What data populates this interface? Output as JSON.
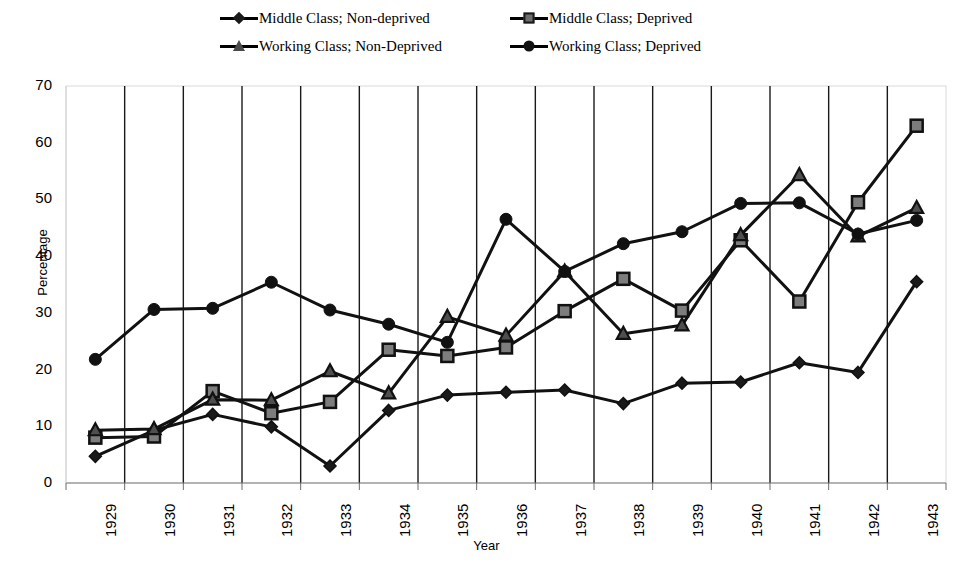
{
  "chart_data": {
    "type": "line",
    "title": "",
    "xlabel": "Year",
    "ylabel": "Percentage",
    "ylim": [
      0,
      70
    ],
    "ytick_step": 10,
    "yticks": [
      0,
      10,
      20,
      30,
      40,
      50,
      60,
      70
    ],
    "grid": "vertical-only",
    "legend_position": "top-center",
    "categories": [
      "1929",
      "1930",
      "1931",
      "1932",
      "1933",
      "1934",
      "1935",
      "1936",
      "1937",
      "1938",
      "1939",
      "1940",
      "1941",
      "1942",
      "1943"
    ],
    "x": [
      "1929",
      "1930",
      "1931",
      "1932",
      "1933",
      "1934",
      "1935",
      "1936",
      "1937",
      "1938",
      "1939",
      "1940",
      "1941",
      "1942",
      "1943"
    ],
    "series": [
      {
        "name": "Middle Class; Non-deprived",
        "marker": "diamond",
        "color": "#1a1a1a",
        "values": [
          4.7,
          9.3,
          12.1,
          9.9,
          3.0,
          12.8,
          15.5,
          16.0,
          16.4,
          14.0,
          17.6,
          17.8,
          21.2,
          19.5,
          35.5
        ]
      },
      {
        "name": "Middle Class; Deprived",
        "marker": "square",
        "color": "#6e6e6e",
        "values": [
          8.0,
          8.2,
          16.2,
          12.3,
          14.3,
          23.5,
          22.4,
          23.9,
          30.3,
          36.0,
          30.4,
          42.8,
          32.0,
          49.5,
          63.0
        ]
      },
      {
        "name": "Working Class; Non-Deprived",
        "marker": "triangle",
        "color": "#4a4a4a",
        "values": [
          9.3,
          9.5,
          14.7,
          14.6,
          19.7,
          15.8,
          29.3,
          26.0,
          37.3,
          26.3,
          27.8,
          43.7,
          54.3,
          43.5,
          48.5
        ]
      },
      {
        "name": "Working Class; Deprived",
        "marker": "circle",
        "color": "#111111",
        "values": [
          21.8,
          30.6,
          30.8,
          35.4,
          30.5,
          28.0,
          24.8,
          46.5,
          37.3,
          42.2,
          44.3,
          49.3,
          49.4,
          43.9,
          46.3
        ]
      }
    ]
  },
  "legend": {
    "items": [
      {
        "label": "Middle Class; Non-deprived",
        "marker": "diamond"
      },
      {
        "label": "Middle Class; Deprived",
        "marker": "square"
      },
      {
        "label": "Working Class; Non-Deprived",
        "marker": "triangle"
      },
      {
        "label": "Working Class; Deprived",
        "marker": "circle"
      }
    ]
  },
  "axes": {
    "y_axis_title": "Percentage",
    "x_axis_title": "Year",
    "y_tick_labels": [
      "70",
      "60",
      "50",
      "40",
      "30",
      "20",
      "10",
      "0"
    ],
    "x_tick_labels": [
      "1929",
      "1930",
      "1931",
      "1932",
      "1933",
      "1934",
      "1935",
      "1936",
      "1937",
      "1938",
      "1939",
      "1940",
      "1941",
      "1942",
      "1943"
    ]
  }
}
